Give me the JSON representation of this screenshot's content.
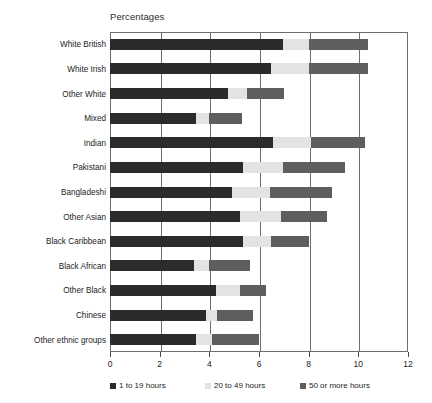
{
  "chart_data": {
    "type": "bar",
    "orientation": "horizontal",
    "stacked": true,
    "title": "Percentages",
    "xlabel": "",
    "ylabel": "",
    "xlim": [
      0,
      12
    ],
    "xticks": [
      0,
      2,
      4,
      6,
      8,
      10,
      12
    ],
    "xtick_labels": [
      "0",
      "2",
      "4",
      "6",
      "8",
      "10",
      "12"
    ],
    "grid": true,
    "grid_axis": "x",
    "legend_position": "bottom",
    "categories": [
      "White British",
      "White Irish",
      "Other White",
      "Mixed",
      "Indian",
      "Pakistani",
      "Bangladeshi",
      "Other Asian",
      "Black Caribbean",
      "Black African",
      "Other Black",
      "Chinese",
      "Other ethnic groups"
    ],
    "series": [
      {
        "name": "1 to 19 hours",
        "color": "#2b2b2b",
        "values": [
          6.95,
          6.5,
          4.75,
          3.45,
          6.55,
          5.35,
          4.9,
          5.25,
          5.35,
          3.4,
          4.25,
          3.85,
          3.45
        ]
      },
      {
        "name": "20 to 49 hours",
        "color": "#e3e3e3",
        "values": [
          1.05,
          1.5,
          0.75,
          0.55,
          1.55,
          1.6,
          1.55,
          1.65,
          1.15,
          0.6,
          1.0,
          0.45,
          0.65
        ]
      },
      {
        "name": "50 or more hours",
        "color": "#5e5e5e",
        "values": [
          2.4,
          2.4,
          1.5,
          1.3,
          2.15,
          2.5,
          2.5,
          1.85,
          1.5,
          1.65,
          1.05,
          1.45,
          1.9
        ]
      }
    ],
    "totals": [
      10.4,
      10.4,
      7.0,
      5.3,
      10.25,
      9.45,
      8.95,
      8.75,
      8.0,
      5.65,
      6.3,
      5.75,
      6.0
    ]
  },
  "legend": {
    "items": [
      {
        "label": "1 to 19 hours",
        "color": "#2b2b2b"
      },
      {
        "label": "20 to 49 hours",
        "color": "#e3e3e3"
      },
      {
        "label": "50 or more hours",
        "color": "#5e5e5e"
      }
    ]
  }
}
